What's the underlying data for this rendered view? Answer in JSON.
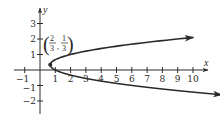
{
  "chart_data": {
    "type": "line",
    "title": "",
    "xlabel": "x",
    "ylabel": "y",
    "xlim": [
      -1.7,
      11.1
    ],
    "ylim": [
      -2.8,
      3.9
    ],
    "grid": false,
    "legend": null,
    "x_ticks": [
      -1,
      1,
      2,
      3,
      4,
      5,
      6,
      7,
      8,
      9,
      10
    ],
    "x_tick_labels": [
      "−1",
      "1",
      "2",
      "3",
      "4",
      "5",
      "6",
      "7",
      "8",
      "9",
      "10"
    ],
    "y_ticks": [
      -2,
      -1,
      1,
      2,
      3
    ],
    "y_tick_labels": [
      "−2",
      "−1",
      "1",
      "2",
      "3"
    ],
    "series": [
      {
        "name": "x = 3y² − 2y + 1",
        "kind": "parabola-opening-right",
        "equation": {
          "a": 3,
          "b": -2,
          "c": 1
        },
        "y_range": [
          -1.6,
          2.1
        ],
        "arrows_at_ends": true,
        "sample_points": [
          {
            "x": 10.0,
            "y": -1.43
          },
          {
            "x": 6.0,
            "y": -1.0
          },
          {
            "x": 2.0,
            "y": -0.33
          },
          {
            "x": 1.0,
            "y": 0.0
          },
          {
            "x": 0.667,
            "y": 0.333
          },
          {
            "x": 1.0,
            "y": 0.667
          },
          {
            "x": 2.0,
            "y": 1.0
          },
          {
            "x": 6.0,
            "y": 1.67
          },
          {
            "x": 10.0,
            "y": 2.1
          }
        ]
      }
    ],
    "annotations": [
      {
        "type": "point",
        "x": 0.667,
        "y": 0.333,
        "label": "(2/3, 1/3)",
        "label_parts": {
          "x_num": "2",
          "x_den": "3",
          "y_num": "1",
          "y_den": "3"
        }
      }
    ]
  }
}
